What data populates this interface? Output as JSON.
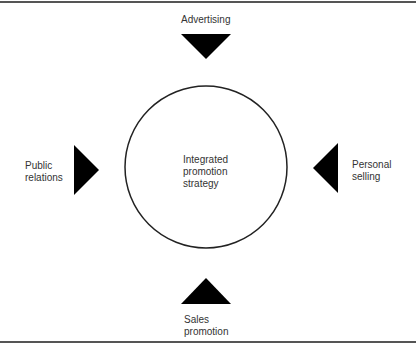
{
  "diagram": {
    "center": {
      "lines": [
        "Integrated",
        "promotion",
        "strategy"
      ]
    },
    "elements": [
      {
        "id": "top",
        "lines": [
          "Advertising"
        ],
        "arrow": "down"
      },
      {
        "id": "left",
        "lines": [
          "Public",
          "relations"
        ],
        "arrow": "right"
      },
      {
        "id": "right",
        "lines": [
          "Personal",
          "selling"
        ],
        "arrow": "left"
      },
      {
        "id": "bottom",
        "lines": [
          "Sales",
          "promotion"
        ],
        "arrow": "up"
      }
    ],
    "colors": {
      "arrow": "#000000",
      "circle_stroke": "#222222",
      "rule": "#555555"
    }
  }
}
